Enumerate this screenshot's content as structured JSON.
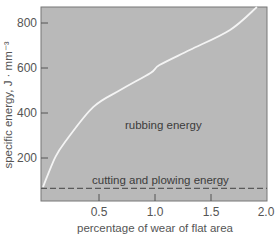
{
  "chart_data": {
    "type": "line",
    "title": "",
    "xlabel": "percentage of wear of flat area",
    "ylabel": "specific energy, J · mm⁻³",
    "xlim": [
      0,
      2.0
    ],
    "ylim": [
      0,
      870
    ],
    "grid": false,
    "legend": null,
    "x_ticks": [
      0.5,
      1.0,
      1.5,
      2.0
    ],
    "x_tick_labels": [
      "0.5",
      "1.0",
      "1.5",
      "2.0"
    ],
    "y_ticks": [
      200,
      400,
      600,
      800
    ],
    "y_tick_labels": [
      "200",
      "400",
      "600",
      "800"
    ],
    "series": [
      {
        "name": "total specific energy",
        "style": "solid white curve",
        "x": [
          0.0,
          0.11,
          0.21,
          0.45,
          0.69,
          0.96,
          1.04,
          1.31,
          1.67,
          1.91
        ],
        "y": [
          71,
          204,
          280,
          427,
          502,
          578,
          613,
          680,
          769,
          871
        ]
      },
      {
        "name": "cutting and plowing energy",
        "style": "dashed horizontal line",
        "x": [
          0.0,
          2.0
        ],
        "y": [
          65,
          65
        ]
      }
    ],
    "annotations": [
      {
        "text": "rubbing energy",
        "x": 0.73,
        "y": 350
      },
      {
        "text": "cutting and plowing energy",
        "x": 0.44,
        "y": 100
      }
    ],
    "colors": {
      "plot_background": "#b9b9b9",
      "curve": "#f4f4f4",
      "dashed_line": "#5a5a5a",
      "axis": "#6a6a6a"
    }
  }
}
